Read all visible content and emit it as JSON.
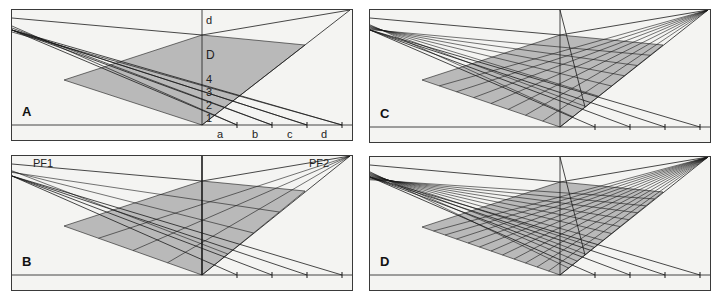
{
  "figure": {
    "colors": {
      "fill": "#b9b9b9",
      "line": "#1a1a1a",
      "background": "#f4f4f2",
      "frame": "#3a3a3a"
    }
  },
  "panels": [
    {
      "id": "A",
      "label": "A",
      "box": {
        "x": 11,
        "y": 9,
        "w": 342,
        "h": 132
      },
      "grid_divisions": 0,
      "diagonal": false,
      "annotations": {
        "vertical": [
          "d",
          "D",
          "4",
          "3",
          "2",
          "1"
        ],
        "ground": [
          "a",
          "b",
          "c",
          "d"
        ]
      }
    },
    {
      "id": "B",
      "label": "B",
      "box": {
        "x": 11,
        "y": 155,
        "w": 342,
        "h": 136
      },
      "grid_divisions": 4,
      "diagonal": false,
      "annotations": {
        "vanishing_points": [
          "PF1",
          "PF2"
        ]
      }
    },
    {
      "id": "C",
      "label": "C",
      "box": {
        "x": 369,
        "y": 9,
        "w": 342,
        "h": 134
      },
      "grid_divisions": 8,
      "diagonal": true
    },
    {
      "id": "D",
      "label": "D",
      "box": {
        "x": 369,
        "y": 156,
        "w": 342,
        "h": 135
      },
      "grid_divisions": 12,
      "diagonal": true
    }
  ]
}
